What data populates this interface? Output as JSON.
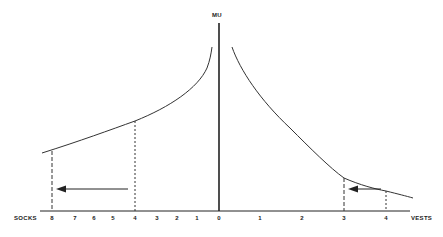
{
  "diagram": {
    "y_axis_label": "MU",
    "left_axis_label": "SOCKS",
    "right_axis_label": "VESTS",
    "left_ticks": [
      {
        "label": "8",
        "x": 52
      },
      {
        "label": "7",
        "x": 75
      },
      {
        "label": "6",
        "x": 94
      },
      {
        "label": "5",
        "x": 113
      },
      {
        "label": "4",
        "x": 135
      },
      {
        "label": "3",
        "x": 157
      },
      {
        "label": "2",
        "x": 177
      },
      {
        "label": "1",
        "x": 197
      }
    ],
    "center_tick": {
      "label": "0",
      "x": 219
    },
    "right_ticks": [
      {
        "label": "1",
        "x": 260
      },
      {
        "label": "2",
        "x": 302
      },
      {
        "label": "3",
        "x": 344
      },
      {
        "label": "4",
        "x": 386
      }
    ],
    "curves": [
      {
        "name": "socks-marginal-utility-curve",
        "direction": "left"
      },
      {
        "name": "vests-marginal-utility-curve",
        "direction": "right"
      }
    ],
    "arrows": [
      {
        "name": "socks-shift-arrow",
        "from": 4,
        "to": 8,
        "axis": "socks"
      },
      {
        "name": "vests-shift-arrow",
        "from": 4,
        "to": 3,
        "axis": "vests"
      }
    ],
    "colors": {
      "ink": "#222222",
      "background": "#ffffff"
    }
  }
}
